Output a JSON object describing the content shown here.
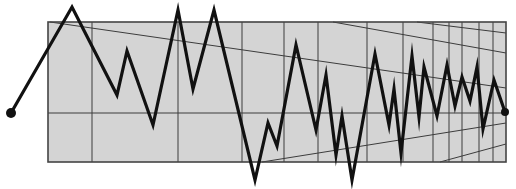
{
  "canvas": {
    "width": 516,
    "height": 189,
    "background": "#ffffff"
  },
  "colors": {
    "panel_fill": "#d4d4d4",
    "panel_border": "#444444",
    "grid_line": "#3c3c3c",
    "signal": "#111111"
  },
  "panel": {
    "x": 48,
    "y": 22,
    "width": 458,
    "height": 140
  },
  "grid": {
    "vertical_x": [
      92,
      178,
      242,
      284,
      318,
      367,
      403,
      433,
      449,
      462,
      479,
      493
    ],
    "horizontal_y": [
      113
    ],
    "perspective_lines": [
      {
        "x1": 50,
        "y1": 22,
        "x2": 506,
        "y2": 88
      },
      {
        "x1": 333,
        "y1": 22,
        "x2": 506,
        "y2": 53
      },
      {
        "x1": 417,
        "y1": 22,
        "x2": 506,
        "y2": 33
      },
      {
        "x1": 262,
        "y1": 162,
        "x2": 506,
        "y2": 123
      },
      {
        "x1": 440,
        "y1": 162,
        "x2": 506,
        "y2": 144
      }
    ]
  },
  "signal": {
    "stroke_width": 3.2,
    "start_marker": {
      "x": 11,
      "y": 113,
      "r": 5
    },
    "end_marker": {
      "x": 505,
      "y": 112,
      "r": 4
    },
    "points": [
      [
        11,
        113
      ],
      [
        72,
        7
      ],
      [
        117,
        95
      ],
      [
        127,
        51
      ],
      [
        153,
        125
      ],
      [
        178,
        10
      ],
      [
        193,
        89
      ],
      [
        214,
        10
      ],
      [
        255,
        180
      ],
      [
        268,
        123
      ],
      [
        277,
        146
      ],
      [
        296,
        45
      ],
      [
        316,
        130
      ],
      [
        326,
        75
      ],
      [
        336,
        155
      ],
      [
        342,
        116
      ],
      [
        352,
        180
      ],
      [
        375,
        54
      ],
      [
        389,
        125
      ],
      [
        394,
        89
      ],
      [
        401,
        153
      ],
      [
        412,
        56
      ],
      [
        419,
        117
      ],
      [
        424,
        67
      ],
      [
        437,
        116
      ],
      [
        447,
        65
      ],
      [
        455,
        106
      ],
      [
        462,
        77
      ],
      [
        470,
        101
      ],
      [
        477,
        67
      ],
      [
        483,
        129
      ],
      [
        494,
        80
      ],
      [
        505,
        112
      ]
    ]
  }
}
